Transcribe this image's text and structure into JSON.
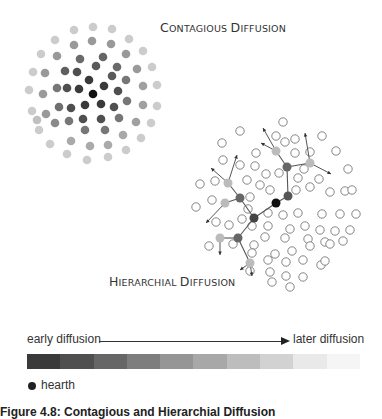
{
  "titles": {
    "contagious": {
      "first_big": "C",
      "rest1": "ONTAGIOUS ",
      "second_big": "D",
      "rest2": "IFFUSION"
    },
    "hierarchial": {
      "first_big": "H",
      "rest1": "IERARCHIAL ",
      "second_big": "D",
      "rest2": "IFFUSION"
    }
  },
  "legend": {
    "early_label": "early diffusion",
    "later_label": "later diffusion",
    "hearth_label": "hearth",
    "gradient_colors": [
      "#3a3a3a",
      "#4f4f4f",
      "#666666",
      "#7d7d7d",
      "#959595",
      "#a8a8a8",
      "#bdbdbd",
      "#d2d2d2",
      "#e9e9e9",
      "#f5f5f5"
    ]
  },
  "caption": "Figure 4.8: Contagious and Hierarchial Diffusion",
  "contagious_dots": [
    {
      "x": 93,
      "y": 94,
      "c": "#111111"
    },
    {
      "x": 89,
      "y": 80,
      "c": "#3a3a3a"
    },
    {
      "x": 104,
      "y": 86,
      "c": "#3a3a3a"
    },
    {
      "x": 79,
      "y": 89,
      "c": "#3a3a3a"
    },
    {
      "x": 85,
      "y": 105,
      "c": "#3a3a3a"
    },
    {
      "x": 101,
      "y": 104,
      "c": "#3a3a3a"
    },
    {
      "x": 77,
      "y": 72,
      "c": "#4f4f4f"
    },
    {
      "x": 96,
      "y": 66,
      "c": "#5a5a5a"
    },
    {
      "x": 112,
      "y": 76,
      "c": "#5a5a5a"
    },
    {
      "x": 118,
      "y": 91,
      "c": "#4f4f4f"
    },
    {
      "x": 114,
      "y": 107,
      "c": "#4f4f4f"
    },
    {
      "x": 67,
      "y": 88,
      "c": "#4f4f4f"
    },
    {
      "x": 71,
      "y": 108,
      "c": "#4f4f4f"
    },
    {
      "x": 83,
      "y": 119,
      "c": "#4f4f4f"
    },
    {
      "x": 101,
      "y": 119,
      "c": "#4f4f4f"
    },
    {
      "x": 65,
      "y": 71,
      "c": "#5f5f5f"
    },
    {
      "x": 80,
      "y": 59,
      "c": "#6a6a6a"
    },
    {
      "x": 103,
      "y": 57,
      "c": "#666666"
    },
    {
      "x": 117,
      "y": 67,
      "c": "#6a6a6a"
    },
    {
      "x": 126,
      "y": 80,
      "c": "#777777"
    },
    {
      "x": 127,
      "y": 101,
      "c": "#777777"
    },
    {
      "x": 119,
      "y": 118,
      "c": "#777777"
    },
    {
      "x": 105,
      "y": 130,
      "c": "#777777"
    },
    {
      "x": 85,
      "y": 130,
      "c": "#777777"
    },
    {
      "x": 69,
      "y": 121,
      "c": "#777777"
    },
    {
      "x": 59,
      "y": 107,
      "c": "#6f6f6f"
    },
    {
      "x": 57,
      "y": 88,
      "c": "#777777"
    },
    {
      "x": 55,
      "y": 123,
      "c": "#8a8a8a"
    },
    {
      "x": 46,
      "y": 114,
      "c": "#9a9a9a"
    },
    {
      "x": 43,
      "y": 94,
      "c": "#9a9a9a"
    },
    {
      "x": 45,
      "y": 73,
      "c": "#999999"
    },
    {
      "x": 57,
      "y": 56,
      "c": "#999999"
    },
    {
      "x": 74,
      "y": 45,
      "c": "#999999"
    },
    {
      "x": 92,
      "y": 41,
      "c": "#999999"
    },
    {
      "x": 111,
      "y": 44,
      "c": "#999999"
    },
    {
      "x": 126,
      "y": 54,
      "c": "#999999"
    },
    {
      "x": 137,
      "y": 69,
      "c": "#9a9a9a"
    },
    {
      "x": 143,
      "y": 86,
      "c": "#a0a0a0"
    },
    {
      "x": 143,
      "y": 105,
      "c": "#a0a0a0"
    },
    {
      "x": 136,
      "y": 122,
      "c": "#a0a0a0"
    },
    {
      "x": 123,
      "y": 135,
      "c": "#a8a8a8"
    },
    {
      "x": 108,
      "y": 145,
      "c": "#aaaaaa"
    },
    {
      "x": 90,
      "y": 146,
      "c": "#aaaaaa"
    },
    {
      "x": 71,
      "y": 141,
      "c": "#aaaaaa"
    },
    {
      "x": 37,
      "y": 120,
      "c": "#c0c0c0"
    },
    {
      "x": 32,
      "y": 111,
      "c": "#cccccc"
    },
    {
      "x": 29,
      "y": 90,
      "c": "#cccccc"
    },
    {
      "x": 33,
      "y": 72,
      "c": "#cccccc"
    },
    {
      "x": 41,
      "y": 54,
      "c": "#cccccc"
    },
    {
      "x": 55,
      "y": 40,
      "c": "#cccccc"
    },
    {
      "x": 74,
      "y": 30,
      "c": "#cccccc"
    },
    {
      "x": 93,
      "y": 27,
      "c": "#cccccc"
    },
    {
      "x": 112,
      "y": 29,
      "c": "#cccccc"
    },
    {
      "x": 129,
      "y": 39,
      "c": "#cccccc"
    },
    {
      "x": 143,
      "y": 51,
      "c": "#cccccc"
    },
    {
      "x": 152,
      "y": 67,
      "c": "#cccccc"
    },
    {
      "x": 157,
      "y": 85,
      "c": "#cccccc"
    },
    {
      "x": 157,
      "y": 106,
      "c": "#cccccc"
    },
    {
      "x": 151,
      "y": 123,
      "c": "#cccccc"
    },
    {
      "x": 141,
      "y": 138,
      "c": "#cccccc"
    },
    {
      "x": 126,
      "y": 150,
      "c": "#cccccc"
    },
    {
      "x": 108,
      "y": 157,
      "c": "#cccccc"
    },
    {
      "x": 87,
      "y": 160,
      "c": "#cccccc"
    },
    {
      "x": 67,
      "y": 154,
      "c": "#cccccc"
    },
    {
      "x": 50,
      "y": 144,
      "c": "#cccccc"
    },
    {
      "x": 39,
      "y": 130,
      "c": "#cccccc"
    }
  ],
  "hierarchial_open_circles": [
    [
      283,
      122
    ],
    [
      240,
      131
    ],
    [
      276,
      136
    ],
    [
      295,
      139
    ],
    [
      322,
      136
    ],
    [
      222,
      143
    ],
    [
      256,
      153
    ],
    [
      295,
      153
    ],
    [
      336,
      151
    ],
    [
      304,
      169
    ],
    [
      223,
      160
    ],
    [
      240,
      165
    ],
    [
      285,
      142
    ],
    [
      310,
      152
    ],
    [
      255,
      166
    ],
    [
      266,
      174
    ],
    [
      260,
      185
    ],
    [
      279,
      173
    ],
    [
      298,
      178
    ],
    [
      319,
      179
    ],
    [
      348,
      169
    ],
    [
      200,
      184
    ],
    [
      215,
      181
    ],
    [
      247,
      180
    ],
    [
      250,
      197
    ],
    [
      270,
      190
    ],
    [
      296,
      190
    ],
    [
      310,
      187
    ],
    [
      330,
      192
    ],
    [
      345,
      191
    ],
    [
      352,
      190
    ],
    [
      196,
      207
    ],
    [
      212,
      200
    ],
    [
      248,
      209
    ],
    [
      268,
      213
    ],
    [
      283,
      215
    ],
    [
      298,
      213
    ],
    [
      322,
      214
    ],
    [
      340,
      214
    ],
    [
      356,
      214
    ],
    [
      216,
      222
    ],
    [
      229,
      225
    ],
    [
      242,
      219
    ],
    [
      252,
      226
    ],
    [
      268,
      226
    ],
    [
      290,
      229
    ],
    [
      305,
      226
    ],
    [
      320,
      230
    ],
    [
      335,
      231
    ],
    [
      350,
      230
    ],
    [
      265,
      237
    ],
    [
      285,
      238
    ],
    [
      308,
      239
    ],
    [
      325,
      242
    ],
    [
      343,
      241
    ],
    [
      209,
      246
    ],
    [
      233,
      244
    ],
    [
      254,
      245
    ],
    [
      275,
      254
    ],
    [
      292,
      251
    ],
    [
      310,
      246
    ],
    [
      252,
      253
    ],
    [
      268,
      260
    ],
    [
      286,
      262
    ],
    [
      303,
      260
    ],
    [
      321,
      265
    ],
    [
      270,
      272
    ],
    [
      286,
      276
    ],
    [
      303,
      277
    ],
    [
      250,
      271
    ],
    [
      272,
      282
    ],
    [
      290,
      287
    ],
    [
      325,
      261
    ],
    [
      330,
      244
    ]
  ],
  "hierarchial_nodes": [
    {
      "id": "hearth",
      "x": 276,
      "y": 203,
      "c": "#111111"
    },
    {
      "id": "n1",
      "x": 288,
      "y": 196,
      "c": "#555555"
    },
    {
      "id": "n2",
      "x": 287,
      "y": 167,
      "c": "#666666"
    },
    {
      "id": "n3",
      "x": 276,
      "y": 151,
      "c": "#bbbbbb"
    },
    {
      "id": "n4",
      "x": 310,
      "y": 163,
      "c": "#bbbbbb"
    },
    {
      "id": "n5",
      "x": 254,
      "y": 218,
      "c": "#444444"
    },
    {
      "id": "n6",
      "x": 240,
      "y": 198,
      "c": "#666666"
    },
    {
      "id": "n7",
      "x": 228,
      "y": 183,
      "c": "#bbbbbb"
    },
    {
      "id": "n8",
      "x": 225,
      "y": 203,
      "c": "#bbbbbb"
    },
    {
      "id": "n9",
      "x": 238,
      "y": 238,
      "c": "#666666"
    },
    {
      "id": "n10",
      "x": 220,
      "y": 238,
      "c": "#bbbbbb"
    },
    {
      "id": "n11",
      "x": 250,
      "y": 263,
      "c": "#bbbbbb"
    }
  ],
  "hierarchial_links": [
    [
      "hearth",
      "n1"
    ],
    [
      "n1",
      "n2"
    ],
    [
      "n2",
      "n3"
    ],
    [
      "n2",
      "n4"
    ],
    [
      "hearth",
      "n5"
    ],
    [
      "n5",
      "n6"
    ],
    [
      "n6",
      "n7"
    ],
    [
      "n6",
      "n8"
    ],
    [
      "n5",
      "n9"
    ],
    [
      "n9",
      "n10"
    ],
    [
      "n9",
      "n11"
    ]
  ],
  "hierarchial_arrows": [
    {
      "from": "n3",
      "x": 263,
      "y": 128
    },
    {
      "from": "n3",
      "x": 261,
      "y": 143
    },
    {
      "from": "n4",
      "x": 305,
      "y": 133
    },
    {
      "from": "n4",
      "x": 331,
      "y": 174
    },
    {
      "from": "n7",
      "x": 237,
      "y": 155
    },
    {
      "from": "n7",
      "x": 211,
      "y": 168
    },
    {
      "from": "n8",
      "x": 206,
      "y": 223
    },
    {
      "from": "n10",
      "x": 220,
      "y": 255
    },
    {
      "from": "n11",
      "x": 240,
      "y": 270
    },
    {
      "from": "n11",
      "x": 252,
      "y": 276
    }
  ]
}
